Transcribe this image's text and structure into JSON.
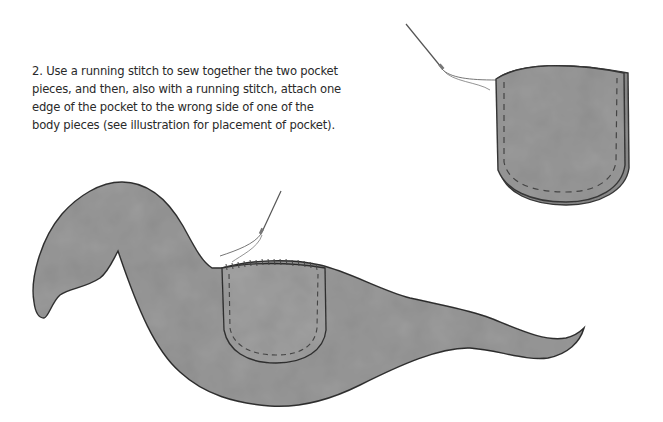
{
  "instruction": {
    "step_number": "2.",
    "lines": [
      "2. Use a running stitch to sew together the two pocket",
      "pieces, and then, also with a running stitch, attach one",
      "edge of the pocket to the wrong side of one of the",
      "body pieces (see illustration for placement of pocket)."
    ]
  },
  "illustrations": {
    "pocket_detail": "pocket pieces sewn together with running stitch, needle and thread",
    "body_with_pocket": "animal body piece with pocket attached, needle and thread"
  },
  "colors": {
    "fabric": "#9a9a9a",
    "fabric_light": "#a8a8a8",
    "outline": "#3a3a3a",
    "stitch": "#4a4a4a",
    "background": "#ffffff"
  }
}
